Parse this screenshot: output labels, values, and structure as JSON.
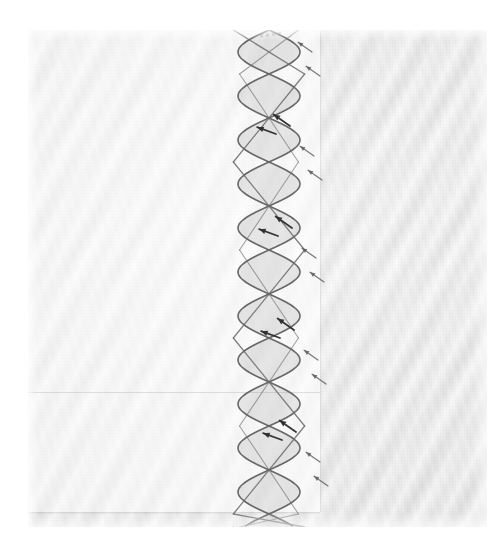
{
  "image": {
    "kind": "scanned-drawing",
    "title": "Hand-drawn double helix with annotation arrows",
    "medium": "pencil on paper, scanned",
    "caption_text": "",
    "width": 503,
    "height": 547
  },
  "canvas": {
    "page_background": "#ffffff",
    "sheet_background": "#ededed",
    "sheet_left": 28,
    "sheet_top": 30,
    "sheet_width": 459,
    "sheet_height": 497,
    "bright_panel_width": 292,
    "bright_panel_height": 482,
    "ink_color": "#5a5a5a",
    "ink_dark_color": "#2e2e2e"
  },
  "chart_data": {
    "type": "line",
    "title": "Hand-drawn double helix with annotation arrows",
    "xlabel": "",
    "ylabel": "",
    "axis_visible": false,
    "grid": false,
    "legend_position": "none",
    "center_x": 241,
    "amplitude": 31,
    "period": 88,
    "y_start": 0,
    "y_end": 497,
    "series": [
      {
        "name": "strand-a",
        "phase_deg": 0,
        "stroke": "#5f5f5f",
        "width": 1.6
      },
      {
        "name": "strand-b",
        "phase_deg": 180,
        "stroke": "#5f5f5f",
        "width": 1.6
      },
      {
        "name": "axis-line",
        "phase_deg": 0,
        "stroke": "#6a6a6a",
        "width": 1.3,
        "note": "straight diagonal line segments zig-zagging through the helix"
      }
    ],
    "annotations": [
      {
        "label": "arrow",
        "x": 284,
        "y": 22,
        "angle_deg": 215
      },
      {
        "label": "arrow",
        "x": 292,
        "y": 46,
        "angle_deg": 215
      },
      {
        "label": "arrow",
        "x": 262,
        "y": 96,
        "angle_deg": 215,
        "emphasis": "dark"
      },
      {
        "label": "arrow",
        "x": 248,
        "y": 104,
        "angle_deg": 200,
        "emphasis": "dark"
      },
      {
        "label": "arrow",
        "x": 286,
        "y": 126,
        "angle_deg": 215
      },
      {
        "label": "arrow",
        "x": 294,
        "y": 150,
        "angle_deg": 215
      },
      {
        "label": "arrow",
        "x": 264,
        "y": 198,
        "angle_deg": 215,
        "emphasis": "dark"
      },
      {
        "label": "arrow",
        "x": 250,
        "y": 206,
        "angle_deg": 200,
        "emphasis": "dark"
      },
      {
        "label": "arrow",
        "x": 288,
        "y": 228,
        "angle_deg": 215
      },
      {
        "label": "arrow",
        "x": 296,
        "y": 252,
        "angle_deg": 215
      },
      {
        "label": "arrow",
        "x": 266,
        "y": 300,
        "angle_deg": 215,
        "emphasis": "dark"
      },
      {
        "label": "arrow",
        "x": 252,
        "y": 308,
        "angle_deg": 200,
        "emphasis": "dark"
      },
      {
        "label": "arrow",
        "x": 290,
        "y": 330,
        "angle_deg": 215
      },
      {
        "label": "arrow",
        "x": 298,
        "y": 354,
        "angle_deg": 215
      },
      {
        "label": "arrow",
        "x": 268,
        "y": 402,
        "angle_deg": 215,
        "emphasis": "dark"
      },
      {
        "label": "arrow",
        "x": 254,
        "y": 410,
        "angle_deg": 200,
        "emphasis": "dark"
      },
      {
        "label": "arrow",
        "x": 292,
        "y": 432,
        "angle_deg": 215
      },
      {
        "label": "arrow",
        "x": 300,
        "y": 456,
        "angle_deg": 215
      }
    ]
  }
}
